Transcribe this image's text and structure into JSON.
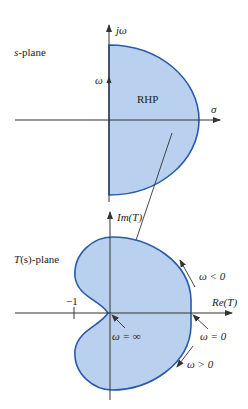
{
  "s_plane": {
    "title_italic": "s",
    "title_rest": "-plane",
    "vertical_axis_label": "jω",
    "horizontal_axis_label": "σ",
    "omega_label": "ω",
    "region_label": "RHP"
  },
  "t_plane": {
    "title_italic": "T",
    "title_paren": "(s)",
    "title_rest": "-plane",
    "vertical_axis_label": "Im(T)",
    "horizontal_axis_label": "Re(T)",
    "minus_one_label": "−1",
    "omega_inf_label": "ω = ∞",
    "omega_zero_label": "ω = 0",
    "omega_neg_label": "ω < 0",
    "omega_pos_label": "ω > 0"
  },
  "colors": {
    "fill": "#b9d1ee",
    "stroke": "#2a5aa8",
    "axis": "#333333"
  }
}
